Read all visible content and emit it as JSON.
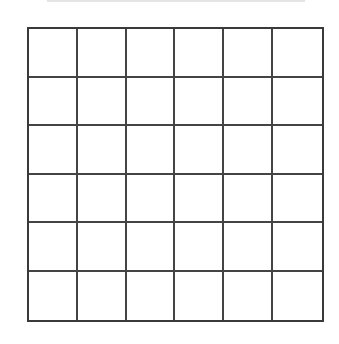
{
  "diagram": {
    "type": "grid",
    "rows": 6,
    "columns": 6,
    "line_color": "#444444",
    "border_color": "#3a3a3a",
    "background": "#ffffff",
    "top_rule_color": "#e4e4e4"
  }
}
